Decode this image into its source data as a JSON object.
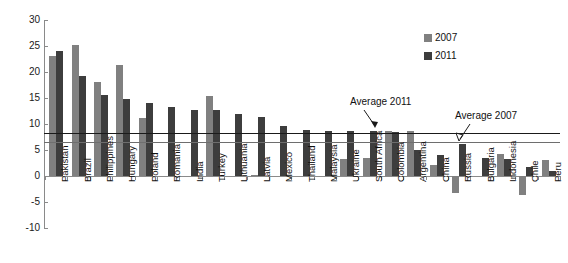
{
  "chart_data": {
    "type": "bar",
    "title": "",
    "xlabel": "",
    "ylabel": "",
    "ylim": [
      -10,
      30
    ],
    "yticks": [
      -10,
      -5,
      0,
      5,
      10,
      15,
      20,
      25,
      30
    ],
    "grid": false,
    "legend_position": "top-right",
    "categories": [
      "Pakistan",
      "Brazil",
      "Philippines",
      "Hungary",
      "Poland",
      "Romania",
      "India",
      "Turkey",
      "Lithuania",
      "Latvia",
      "Mexico",
      "Thailand",
      "Malaysia",
      "Ukraine",
      "South Africa",
      "Colombia",
      "Argentina",
      "China",
      "Russia",
      "Bulgaria",
      "Indonesia",
      "Chile",
      "Peru"
    ],
    "series": [
      {
        "name": "2007",
        "color": "#808080",
        "values": [
          23.0,
          25.2,
          18.1,
          21.4,
          11.1,
          0.0,
          0.0,
          15.3,
          0.0,
          0.2,
          0.0,
          0.0,
          0.0,
          3.2,
          3.5,
          8.6,
          8.6,
          2.1,
          -3.3,
          0.0,
          4.3,
          -3.6,
          3.0
        ]
      },
      {
        "name": "2011",
        "color": "#3d3d3d",
        "values": [
          24.0,
          19.2,
          15.5,
          14.9,
          14.0,
          13.2,
          12.7,
          12.6,
          12.0,
          11.3,
          9.7,
          8.8,
          8.7,
          8.6,
          8.6,
          8.5,
          5.0,
          4.0,
          6.2,
          3.4,
          3.2,
          1.7,
          1.0
        ]
      }
    ],
    "reference_lines": [
      {
        "label": "Average 2011",
        "value": 8.3,
        "color": "#1a1a1a"
      },
      {
        "label": "Average 2007",
        "value": 6.6,
        "color": "#6e6e6e"
      }
    ]
  },
  "legend": {
    "items": [
      {
        "label": "2007"
      },
      {
        "label": "2011"
      }
    ]
  },
  "annotations": {
    "average_2011": "Average 2011",
    "average_2007": "Average 2007"
  },
  "title_remnant": ""
}
